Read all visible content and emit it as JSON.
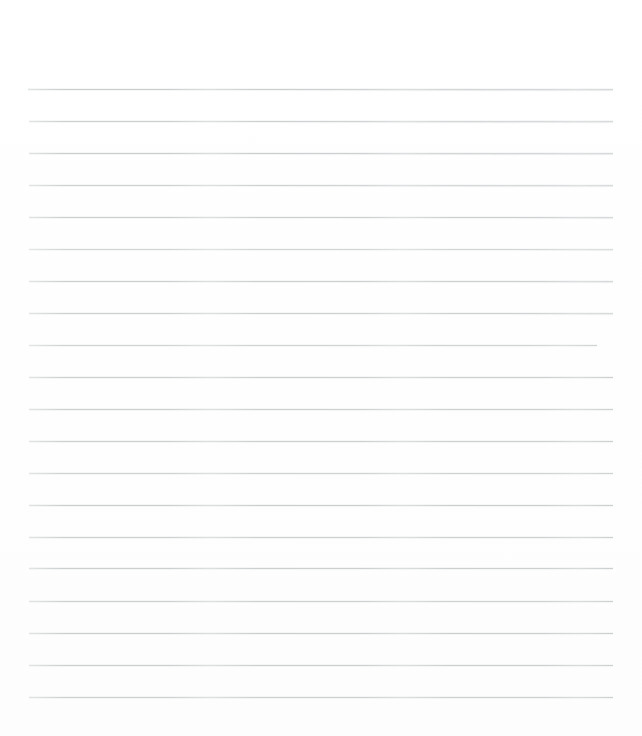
{
  "page": {
    "kind": "scanned-lined-paper",
    "width": 642,
    "height": 736,
    "background_color": "#ffffff",
    "paper_color": "#fefefe",
    "content_text": ""
  },
  "ruling": {
    "line_color": "#c9cbcd",
    "line_thickness": 1,
    "line_count": 20,
    "line_spacing": 32,
    "margin_top": 88,
    "margin_bottom": 39,
    "margin_left": 28,
    "margin_right": 29,
    "default_left": 28,
    "default_right": 613,
    "lines": [
      {
        "index": 1,
        "y": 89,
        "left": 28,
        "right": 613,
        "slope": 0.6,
        "opacity": 0.95
      },
      {
        "index": 2,
        "y": 121,
        "left": 29,
        "right": 613,
        "slope": 0.5,
        "opacity": 0.92
      },
      {
        "index": 3,
        "y": 153,
        "left": 29,
        "right": 613,
        "slope": 0.5,
        "opacity": 0.96
      },
      {
        "index": 4,
        "y": 185,
        "left": 29,
        "right": 613,
        "slope": 0.5,
        "opacity": 0.9
      },
      {
        "index": 5,
        "y": 217,
        "left": 29,
        "right": 613,
        "slope": 0.4,
        "opacity": 0.94
      },
      {
        "index": 6,
        "y": 249,
        "left": 29,
        "right": 613,
        "slope": 0.4,
        "opacity": 0.82
      },
      {
        "index": 7,
        "y": 281,
        "left": 29,
        "right": 613,
        "slope": 0.4,
        "opacity": 0.93
      },
      {
        "index": 8,
        "y": 313,
        "left": 29,
        "right": 613,
        "slope": 0.4,
        "opacity": 0.9
      },
      {
        "index": 9,
        "y": 345,
        "left": 29,
        "right": 597,
        "slope": 0.3,
        "opacity": 0.86
      },
      {
        "index": 10,
        "y": 377,
        "left": 29,
        "right": 613,
        "slope": 0.3,
        "opacity": 0.93
      },
      {
        "index": 11,
        "y": 409,
        "left": 29,
        "right": 613,
        "slope": 0.3,
        "opacity": 0.9
      },
      {
        "index": 12,
        "y": 441,
        "left": 29,
        "right": 613,
        "slope": 0.3,
        "opacity": 0.92
      },
      {
        "index": 13,
        "y": 473,
        "left": 29,
        "right": 613,
        "slope": 0.2,
        "opacity": 0.88
      },
      {
        "index": 14,
        "y": 505,
        "left": 29,
        "right": 613,
        "slope": 0.2,
        "opacity": 0.94
      },
      {
        "index": 15,
        "y": 537,
        "left": 29,
        "right": 613,
        "slope": 0.2,
        "opacity": 0.91
      },
      {
        "index": 16,
        "y": 568,
        "left": 29,
        "right": 613,
        "slope": 0.2,
        "opacity": 0.93
      },
      {
        "index": 17,
        "y": 601,
        "left": 29,
        "right": 613,
        "slope": 0.2,
        "opacity": 0.9
      },
      {
        "index": 18,
        "y": 633,
        "left": 29,
        "right": 613,
        "slope": 0.2,
        "opacity": 0.95
      },
      {
        "index": 19,
        "y": 665,
        "left": 29,
        "right": 613,
        "slope": 0.1,
        "opacity": 0.92
      },
      {
        "index": 20,
        "y": 697,
        "left": 29,
        "right": 613,
        "slope": 0.1,
        "opacity": 0.9
      }
    ]
  }
}
